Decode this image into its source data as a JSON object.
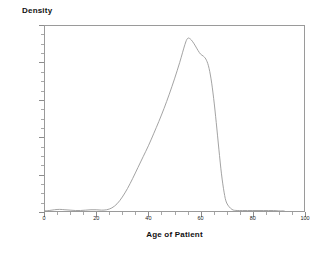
{
  "figure": {
    "background": "#ffffff",
    "frame_color": "#9a9a9a",
    "curve_color": "#999999"
  },
  "axes": {
    "y_title": "Density",
    "x_title": "Age of Patient",
    "y_ticks": [
      "0",
      "0.01",
      "0.02",
      "0.03",
      "0.04",
      "0.05"
    ],
    "x_ticks": [
      "0",
      "20",
      "40",
      "60",
      "80",
      "100"
    ]
  },
  "chart_data": {
    "type": "line",
    "title": "",
    "subtitle": "",
    "xlabel": "Age of Patient",
    "ylabel": "Density",
    "xlim": [
      0,
      100
    ],
    "ylim": [
      0,
      0.05
    ],
    "x_ticks": [
      0,
      20,
      40,
      60,
      80,
      100
    ],
    "y_ticks": [
      0,
      0.01,
      0.02,
      0.03,
      0.04,
      0.05
    ],
    "x_minor_tick_step": 5,
    "y_minor_tick_step": 0.0025,
    "grid": false,
    "legend": null,
    "legend_position": "none",
    "annotations": [],
    "series": [
      {
        "name": "Kernel density of patient age",
        "color": "#999999",
        "line_width": 1,
        "x": [
          0,
          2,
          4,
          6,
          8,
          10,
          12,
          14,
          16,
          18,
          20,
          22,
          24,
          26,
          28,
          30,
          32,
          34,
          36,
          38,
          40,
          42,
          44,
          46,
          48,
          50,
          52,
          54,
          55,
          56,
          57,
          58,
          59,
          60,
          61,
          62,
          63,
          64,
          65,
          66,
          67,
          68,
          69,
          70,
          72,
          74,
          76,
          78,
          80,
          82,
          84,
          86,
          88,
          90,
          92
        ],
        "y": [
          0.0003,
          0.0004,
          0.0006,
          0.0007,
          0.0006,
          0.0005,
          0.0004,
          0.0004,
          0.0005,
          0.0006,
          0.0006,
          0.0005,
          0.0006,
          0.0011,
          0.0022,
          0.004,
          0.0063,
          0.009,
          0.0119,
          0.0148,
          0.0177,
          0.0209,
          0.0242,
          0.0277,
          0.0315,
          0.0356,
          0.04,
          0.0448,
          0.0464,
          0.0463,
          0.0455,
          0.0444,
          0.0432,
          0.0422,
          0.0417,
          0.0409,
          0.0391,
          0.0356,
          0.0304,
          0.0239,
          0.0168,
          0.0102,
          0.0053,
          0.0024,
          0.0007,
          0.0004,
          0.0004,
          0.0004,
          0.0004,
          0.0004,
          0.0004,
          0.0004,
          0.0004,
          0.0003,
          0.0003
        ]
      }
    ],
    "peak": {
      "x": 55,
      "y": 0.0465
    }
  }
}
